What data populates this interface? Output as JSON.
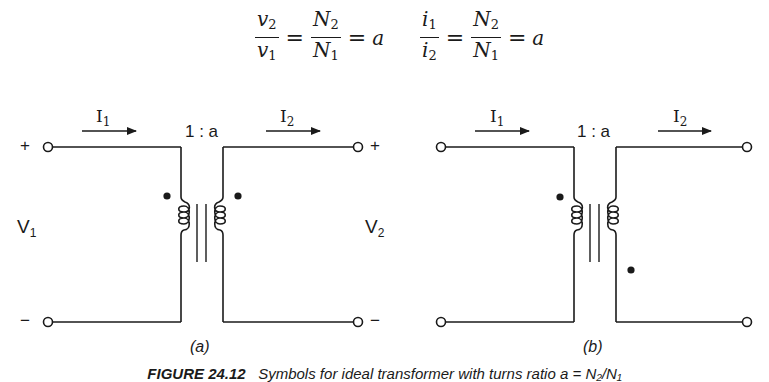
{
  "equations": {
    "voltage": {
      "numerator": "v",
      "numerator_sub": "2",
      "denominator": "v",
      "denominator_sub": "1",
      "ratio_num": "N",
      "ratio_num_sub": "2",
      "ratio_den": "N",
      "ratio_den_sub": "1",
      "equals": "=",
      "result": "a"
    },
    "current": {
      "numerator": "i",
      "numerator_sub": "1",
      "denominator": "i",
      "denominator_sub": "2",
      "ratio_num": "N",
      "ratio_num_sub": "2",
      "ratio_den": "N",
      "ratio_den_sub": "1",
      "equals": "=",
      "result": "a"
    }
  },
  "circuit_a": {
    "label": "(a)",
    "turns_ratio": "1 : a",
    "current_in": {
      "symbol": "I",
      "sub": "1"
    },
    "current_out": {
      "symbol": "I",
      "sub": "2"
    },
    "voltage_in": {
      "symbol": "V",
      "sub": "1"
    },
    "voltage_out": {
      "symbol": "V",
      "sub": "2"
    },
    "plus_left": "+",
    "minus_left": "−",
    "plus_right": "+",
    "minus_right": "−",
    "dot_convention": "both-top"
  },
  "circuit_b": {
    "label": "(b)",
    "turns_ratio": "1 : a",
    "current_in": {
      "symbol": "I",
      "sub": "1"
    },
    "current_out": {
      "symbol": "I",
      "sub": "2"
    },
    "dot_convention": "primary-top-secondary-bottom"
  },
  "caption": {
    "figure_number": "FIGURE 24.12",
    "text": "Symbols for ideal transformer with turns ratio a = N₂/N₁"
  },
  "colors": {
    "ink": "#1a1a1a",
    "background": "#ffffff"
  }
}
